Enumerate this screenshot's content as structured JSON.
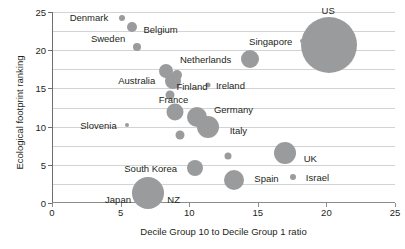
{
  "chart_data": {
    "type": "scatter",
    "title": "",
    "xlabel": "Decile Group 10 to Decile Group 1 ratio",
    "ylabel": "Ecological footprint ranking",
    "xlim": [
      0,
      25
    ],
    "ylim": [
      0,
      25
    ],
    "xticks": [
      0,
      5,
      10,
      15,
      20,
      25
    ],
    "yticks": [
      0,
      5,
      10,
      15,
      20,
      25
    ],
    "gridlines_y": [
      2.5,
      5,
      7.5,
      10,
      12.5,
      15,
      17.5,
      20,
      22.5,
      25
    ],
    "grid": true,
    "legend": "none",
    "bubble_color": "#9a9b9d",
    "points": [
      {
        "label": "Denmark",
        "x": 5.1,
        "y": 24.2,
        "r": 3.0,
        "label_dx": -33,
        "label_dy": -1
      },
      {
        "label": "Belgium",
        "x": 5.8,
        "y": 23.0,
        "r": 5.0,
        "label_dx": 29,
        "label_dy": 2
      },
      {
        "label": "Sweden",
        "x": 6.2,
        "y": 20.4,
        "r": 4.0,
        "label_dx": -29,
        "label_dy": -9
      },
      {
        "label": "Singapore",
        "x": 18.2,
        "y": 21.2,
        "r": 2.0,
        "label_dx": -31,
        "label_dy": 0
      },
      {
        "label": "US",
        "x": 20.2,
        "y": 20.7,
        "r": 28.0,
        "label_dx": -1,
        "label_dy": -35
      },
      {
        "label": "Netherlands",
        "x": 14.4,
        "y": 18.9,
        "r": 9.0,
        "label_dx": -44,
        "label_dy": 0
      },
      {
        "label": "",
        "x": 8.3,
        "y": 17.3,
        "r": 7.0,
        "label_dx": 0,
        "label_dy": 0
      },
      {
        "label": "Australia",
        "x": 8.8,
        "y": 16.0,
        "r": 8.0,
        "label_dx": -36,
        "label_dy": -1
      },
      {
        "label": "",
        "x": 9.1,
        "y": 16.8,
        "r": 5.0,
        "label_dx": 0,
        "label_dy": 0
      },
      {
        "label": "Ireland",
        "x": 11.4,
        "y": 15.4,
        "r": 2.5,
        "label_dx": 22,
        "label_dy": 0
      },
      {
        "label": "Finland",
        "x": 8.6,
        "y": 14.2,
        "r": 4.5,
        "label_dx": 22,
        "label_dy": -9
      },
      {
        "label": "France",
        "x": 9.0,
        "y": 11.9,
        "r": 8.5,
        "label_dx": -2,
        "label_dy": -13
      },
      {
        "label": "Germany",
        "x": 10.6,
        "y": 11.2,
        "r": 10.0,
        "label_dx": 36,
        "label_dy": -8
      },
      {
        "label": "Slovenia",
        "x": 5.5,
        "y": 10.2,
        "r": 2.0,
        "label_dx": -29,
        "label_dy": 0
      },
      {
        "label": "Italy",
        "x": 11.4,
        "y": 10.0,
        "r": 11.0,
        "label_dx": 30,
        "label_dy": 3
      },
      {
        "label": "",
        "x": 9.3,
        "y": 8.9,
        "r": 4.5,
        "label_dx": 0,
        "label_dy": 0
      },
      {
        "label": "UK",
        "x": 17.0,
        "y": 6.5,
        "r": 11.0,
        "label_dx": 25,
        "label_dy": 5
      },
      {
        "label": "",
        "x": 12.8,
        "y": 6.1,
        "r": 3.5,
        "label_dx": 0,
        "label_dy": 0
      },
      {
        "label": "South Korea",
        "x": 10.4,
        "y": 4.6,
        "r": 8.0,
        "label_dx": -44,
        "label_dy": 0
      },
      {
        "label": "Spain",
        "x": 13.3,
        "y": 3.0,
        "r": 10.0,
        "label_dx": 32,
        "label_dy": -2
      },
      {
        "label": "Israel",
        "x": 17.6,
        "y": 3.4,
        "r": 3.0,
        "label_dx": 24,
        "label_dy": 0
      },
      {
        "label": "Japan",
        "x": 7.0,
        "y": 1.3,
        "r": 16.0,
        "label_dx": -30,
        "label_dy": 6
      },
      {
        "label": "NZ",
        "x": 7.7,
        "y": 0.5,
        "r": 3.0,
        "label_dx": 16,
        "label_dy": 0
      }
    ]
  }
}
